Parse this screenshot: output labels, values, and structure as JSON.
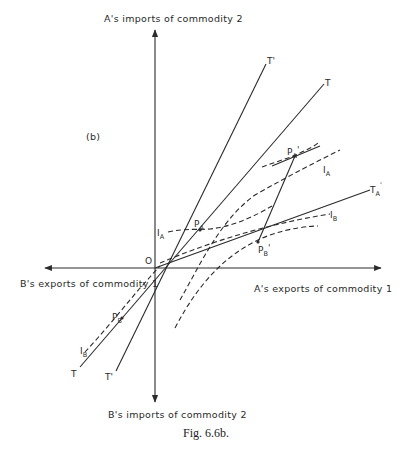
{
  "figure": {
    "panel_label": "(b)",
    "caption": "Fig. 6.6b.",
    "origin_label": "O"
  },
  "axes": {
    "top": "A's imports of commodity 2",
    "bottom": "B's imports of commodity 2",
    "right": "A's exports of commodity 1",
    "left": "B's exports of commodity 1"
  },
  "lines": {
    "T_top": "T",
    "T_bottom": "T",
    "T_prime_top": "T'",
    "T_prime_bottom": "T'",
    "T_A_prime": "T",
    "T_A_prime_sub": "A",
    "T_A_prime_sup": "'"
  },
  "curves": {
    "I_A_left": "I",
    "I_A_left_sub": "A",
    "I_A_right": "I",
    "I_A_right_sub": "A",
    "I_B_right": "I",
    "I_B_right_sub": "B",
    "I_B_left": "I",
    "I_B_left_sub": "B"
  },
  "points": {
    "P_A": "P",
    "P_A_sub": "A",
    "P_A_prime": "P",
    "P_A_prime_sub": "A",
    "P_B": "P",
    "P_B_sub": "B",
    "P_B_prime": "P",
    "P_B_prime_sub": "B"
  }
}
